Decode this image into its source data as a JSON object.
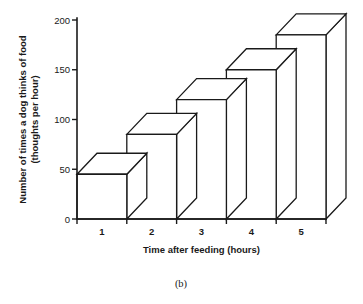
{
  "figure": {
    "caption": "(b)"
  },
  "chart_data": {
    "type": "bar",
    "title": "",
    "subtitle": "",
    "xlabel": "Time after feeding (hours)",
    "ylabel": "Number of times a dog thinks of food (thoughts per hour)",
    "ylabel_line1": "Number of times a dog thinks of food",
    "ylabel_line2": "(thoughts per hour)",
    "categories": [
      "1",
      "2",
      "3",
      "4",
      "5"
    ],
    "values": [
      45,
      85,
      120,
      150,
      185
    ],
    "x": [
      1,
      2,
      3,
      4,
      5
    ],
    "xlim": [
      0,
      5
    ],
    "ylim": [
      0,
      200
    ],
    "yticks": [
      0,
      50,
      100,
      150,
      200
    ],
    "ytick_labels": [
      "0",
      "50",
      "100",
      "150",
      "200"
    ],
    "xticks": [
      1,
      2,
      3,
      4,
      5
    ],
    "xtick_labels": [
      "1",
      "2",
      "3",
      "4",
      "5"
    ],
    "grid": false,
    "legend": false,
    "style": "3d-bars-outline",
    "colors": {
      "axis": "#1a1a1a",
      "bar_fill": "#ffffff",
      "bar_stroke": "#1a1a1a"
    }
  }
}
